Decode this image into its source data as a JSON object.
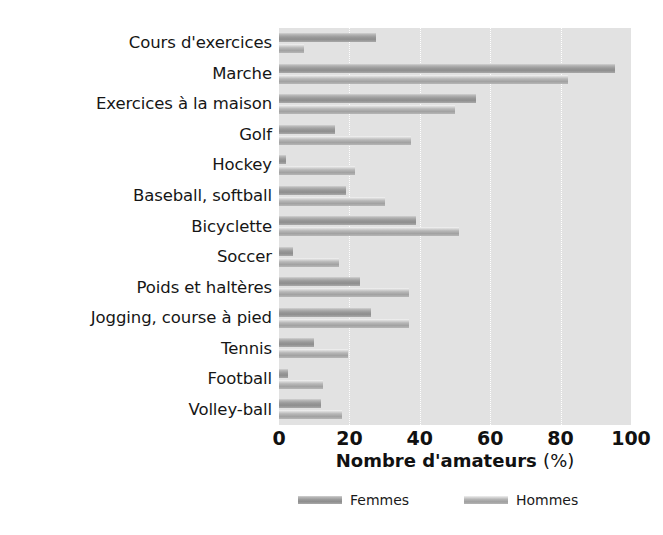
{
  "chart_data": {
    "type": "bar",
    "orientation": "horizontal",
    "title": "",
    "subtitle": "",
    "xlabel": "Nombre d'amateurs",
    "xlabel_unit": "(%)",
    "ylabel": "",
    "xlim": [
      0,
      100
    ],
    "xticks": [
      0,
      20,
      40,
      60,
      80,
      100
    ],
    "xtick_labels": [
      "0",
      "20",
      "40",
      "60",
      "80",
      "100"
    ],
    "grid": "vertical-dotted-white",
    "plot_background": "#e2e2e2",
    "legend_position": "bottom",
    "categories": [
      "Cours d'exercices",
      "Marche",
      "Exercices à la maison",
      "Golf",
      "Hockey",
      "Baseball, softball",
      "Bicyclette",
      "Soccer",
      "Poids et haltères",
      "Jogging, course à pied",
      "Tennis",
      "Football",
      "Volley-ball"
    ],
    "series": [
      {
        "name": "Femmes",
        "color": "#9a9a9a",
        "values": [
          27.5,
          95.5,
          56,
          16,
          2,
          19,
          39,
          4,
          23,
          26,
          10,
          2.5,
          12
        ]
      },
      {
        "name": "Hommes",
        "color": "#b6b6b6",
        "values": [
          7,
          82,
          50,
          37.5,
          21.5,
          30,
          51,
          17,
          37,
          37,
          19.5,
          12.5,
          18
        ]
      }
    ]
  },
  "legend": {
    "items": [
      {
        "label": "Femmes",
        "swatch": "femmes"
      },
      {
        "label": "Hommes",
        "swatch": "hommes"
      }
    ]
  }
}
